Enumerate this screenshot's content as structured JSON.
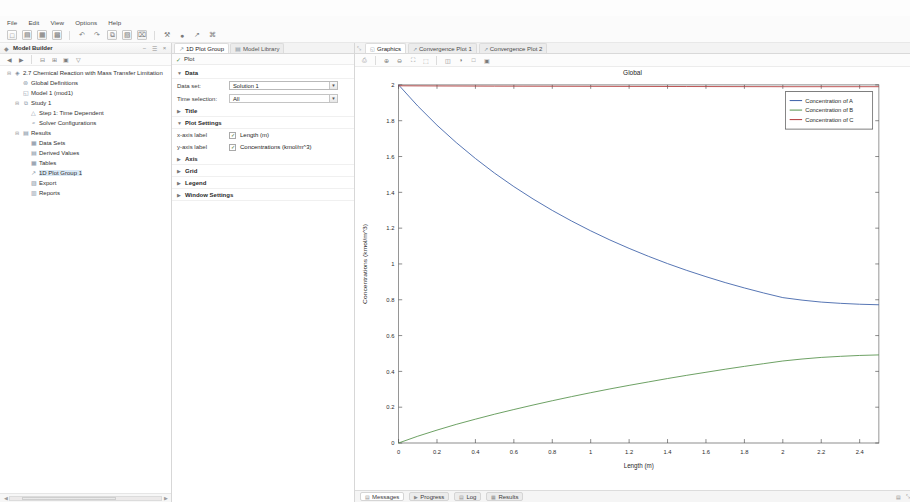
{
  "menu": {
    "items": [
      {
        "label": "File"
      },
      {
        "label": "Edit"
      },
      {
        "label": "View"
      },
      {
        "label": "Options"
      },
      {
        "label": "Help"
      }
    ]
  },
  "toolbar": {
    "icons": [
      {
        "name": "new-icon",
        "glyph": "□"
      },
      {
        "name": "open-icon",
        "glyph": "▤"
      },
      {
        "name": "save-icon",
        "glyph": "▦"
      },
      {
        "name": "save-as-icon",
        "glyph": "▩"
      },
      {
        "name": "undo-icon",
        "glyph": "↶"
      },
      {
        "name": "redo-icon",
        "glyph": "↷"
      },
      {
        "name": "copy-icon",
        "glyph": "⧉"
      },
      {
        "name": "paste-icon",
        "glyph": "▧"
      },
      {
        "name": "delete-icon",
        "glyph": "⌧"
      },
      {
        "name": "build-icon",
        "glyph": "⚒"
      },
      {
        "name": "compute-icon",
        "glyph": "●"
      },
      {
        "name": "plot-icon",
        "glyph": "↗"
      },
      {
        "name": "help-icon",
        "glyph": "⌘"
      }
    ]
  },
  "left_panel": {
    "title": "Model Builder",
    "header_buttons": [
      {
        "name": "collapse-all-button",
        "glyph": "−"
      },
      {
        "name": "pin-button",
        "glyph": "☰"
      },
      {
        "name": "close-button",
        "glyph": "×"
      }
    ],
    "toolbar_icons": [
      {
        "name": "back-icon",
        "glyph": "◀"
      },
      {
        "name": "forward-icon",
        "glyph": "▶"
      },
      {
        "name": "collapse-icon",
        "glyph": "⊟"
      },
      {
        "name": "expand-icon",
        "glyph": "⊞"
      },
      {
        "name": "show-icon",
        "glyph": "▣"
      },
      {
        "name": "filter-icon",
        "glyph": "▽"
      }
    ],
    "tree": [
      {
        "label": "2.7 Chemical Reaction with Mass Transfer Limitation",
        "indent": 0,
        "expander": "⊟",
        "icon": "◈",
        "selected": false
      },
      {
        "label": "Global Definitions",
        "indent": 1,
        "expander": "",
        "icon": "⊚",
        "selected": false
      },
      {
        "label": "Model 1 (mod1)",
        "indent": 1,
        "expander": "",
        "icon": "◱",
        "selected": false
      },
      {
        "label": "Study 1",
        "indent": 1,
        "expander": "⊟",
        "icon": "⧉",
        "selected": false
      },
      {
        "label": "Step 1: Time Dependent",
        "indent": 2,
        "expander": "",
        "icon": "△",
        "selected": false
      },
      {
        "label": "Solver Configurations",
        "indent": 2,
        "expander": "",
        "icon": "≈",
        "selected": false
      },
      {
        "label": "Results",
        "indent": 1,
        "expander": "⊟",
        "icon": "▤",
        "selected": false
      },
      {
        "label": "Data Sets",
        "indent": 2,
        "expander": "",
        "icon": "▦",
        "selected": false
      },
      {
        "label": "Derived Values",
        "indent": 2,
        "expander": "",
        "icon": "▤",
        "selected": false
      },
      {
        "label": "Tables",
        "indent": 2,
        "expander": "",
        "icon": "▦",
        "selected": false
      },
      {
        "label": "1D Plot Group 1",
        "indent": 2,
        "expander": "",
        "icon": "↗",
        "selected": true
      },
      {
        "label": "Export",
        "indent": 2,
        "expander": "",
        "icon": "▨",
        "selected": false
      },
      {
        "label": "Reports",
        "indent": 2,
        "expander": "",
        "icon": "▥",
        "selected": false
      }
    ]
  },
  "settings_panel": {
    "tabs": [
      {
        "label": "1D Plot Group",
        "icon": "↗",
        "active": true
      },
      {
        "label": "Model Library",
        "icon": "▤",
        "active": false
      }
    ],
    "plot_button": {
      "label": "Plot",
      "icon": "✓"
    },
    "sections": [
      {
        "name": "data",
        "title": "Data",
        "expanded": true,
        "tri": "▼"
      },
      {
        "name": "title",
        "title": "Title",
        "expanded": false,
        "tri": "▶"
      },
      {
        "name": "plot-settings",
        "title": "Plot Settings",
        "expanded": true,
        "tri": "▼"
      },
      {
        "name": "axis",
        "title": "Axis",
        "expanded": false,
        "tri": "▶"
      },
      {
        "name": "grid",
        "title": "Grid",
        "expanded": false,
        "tri": "▶"
      },
      {
        "name": "legend",
        "title": "Legend",
        "expanded": false,
        "tri": "▶"
      },
      {
        "name": "window-settings",
        "title": "Window Settings",
        "expanded": false,
        "tri": "▶"
      }
    ],
    "data_set": {
      "label": "Data set:",
      "value": "Solution 1"
    },
    "time_selection": {
      "label": "Time selection:",
      "value": "All"
    },
    "x_axis_label": {
      "label": "x-axis label",
      "value": "Length (m)",
      "checked": true
    },
    "y_axis_label": {
      "label": "y-axis label",
      "value": "Concentrations (kmol/m^3)",
      "checked": true
    },
    "side_button_icon": "▤"
  },
  "graphics_panel": {
    "pin_icon": "⤡",
    "tabs": [
      {
        "label": "Graphics",
        "icon": "◱",
        "active": true
      },
      {
        "label": "Convergence Plot 1",
        "icon": "↗",
        "active": false
      },
      {
        "label": "Convergence Plot 2",
        "icon": "↗",
        "active": false
      }
    ],
    "tools": [
      {
        "name": "print-icon",
        "glyph": "⎙"
      },
      {
        "name": "zoom-in-icon",
        "glyph": "⊕"
      },
      {
        "name": "zoom-out-icon",
        "glyph": "⊖"
      },
      {
        "name": "zoom-extents-icon",
        "glyph": "⛶"
      },
      {
        "name": "zoom-box-icon",
        "glyph": "⬚"
      },
      {
        "name": "transparency-icon",
        "glyph": "◫"
      },
      {
        "name": "scene-light-icon",
        "glyph": "◑"
      },
      {
        "name": "select-icon",
        "glyph": "□"
      },
      {
        "name": "camera-icon",
        "glyph": "▣"
      }
    ]
  },
  "status_bar": {
    "tabs": [
      {
        "label": "Messages",
        "icon": "▤",
        "active": true
      },
      {
        "label": "Progress",
        "icon": "▶",
        "active": false
      },
      {
        "label": "Log",
        "icon": "▤",
        "active": false
      },
      {
        "label": "Results",
        "icon": "▦",
        "active": false
      }
    ],
    "right_icons": [
      {
        "name": "memory-icon",
        "glyph": "▤"
      },
      {
        "name": "resize-grip-icon",
        "glyph": "⤡"
      }
    ]
  },
  "chart_data": {
    "type": "line",
    "title": "Global",
    "xlabel": "Length (m)",
    "ylabel": "Concentrations (kmol/m^3)",
    "xlim": [
      0,
      2.5
    ],
    "ylim": [
      0,
      2
    ],
    "xticks": [
      0,
      0.2,
      0.4,
      0.6,
      0.8,
      1,
      1.2,
      1.4,
      1.6,
      1.8,
      2,
      2.2,
      2.4
    ],
    "yticks": [
      0,
      0.2,
      0.4,
      0.6,
      0.8,
      1,
      1.2,
      1.4,
      1.6,
      1.8,
      2
    ],
    "grid": false,
    "legend_position": "top-right",
    "series": [
      {
        "name": "Concentration of A",
        "color": "#3b5fa8",
        "x": [
          0,
          0.1,
          0.2,
          0.3,
          0.4,
          0.5,
          0.6,
          0.7,
          0.8,
          0.9,
          1.0,
          1.1,
          1.2,
          1.3,
          1.4,
          1.5,
          1.6,
          1.7,
          1.8,
          1.9,
          2.0,
          2.1,
          2.2,
          2.3,
          2.4,
          2.5
        ],
        "y": [
          2.0,
          1.882,
          1.775,
          1.678,
          1.589,
          1.507,
          1.432,
          1.363,
          1.299,
          1.24,
          1.185,
          1.134,
          1.087,
          1.043,
          1.002,
          0.964,
          0.929,
          0.896,
          0.866,
          0.838,
          0.812,
          0.798,
          0.787,
          0.78,
          0.775,
          0.772
        ]
      },
      {
        "name": "Concentration of B",
        "color": "#55924a",
        "x": [
          0,
          0.1,
          0.2,
          0.3,
          0.4,
          0.5,
          0.6,
          0.7,
          0.8,
          0.9,
          1.0,
          1.1,
          1.2,
          1.3,
          1.4,
          1.5,
          1.6,
          1.7,
          1.8,
          1.9,
          2.0,
          2.1,
          2.2,
          2.3,
          2.4,
          2.5
        ],
        "y": [
          0.0,
          0.038,
          0.072,
          0.104,
          0.133,
          0.161,
          0.187,
          0.212,
          0.236,
          0.259,
          0.281,
          0.302,
          0.322,
          0.341,
          0.36,
          0.378,
          0.395,
          0.412,
          0.428,
          0.443,
          0.458,
          0.469,
          0.478,
          0.484,
          0.489,
          0.492
        ]
      },
      {
        "name": "Concentration of C",
        "color": "#b23a3a",
        "x": [
          0,
          0.2,
          0.5,
          1.0,
          1.5,
          2.0,
          2.5
        ],
        "y": [
          1.995,
          1.994,
          1.993,
          1.992,
          1.991,
          1.99,
          1.99
        ]
      }
    ]
  }
}
